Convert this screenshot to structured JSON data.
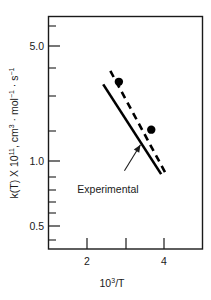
{
  "chart_data": {
    "type": "line",
    "title": "",
    "xlabel": "10^3/T",
    "xlabel_base": "10",
    "xlabel_exp": "3",
    "xlabel_tail": "/T",
    "ylabel": "k(T) X 10^11, cm^3 . mol^-1 . s^-1",
    "ylabel_parts": {
      "p1": "k(T) X 10",
      "p2": "11",
      "p3": ", cm",
      "p4": "3",
      "p5": " · mol",
      "p6": "−1",
      "p7": " · s",
      "p8": "−1"
    },
    "xscale": "log",
    "yscale": "log",
    "xlim": [
      1.35,
      5.2
    ],
    "ylim": [
      0.38,
      7.2
    ],
    "grid": false,
    "legend": "none",
    "x_ticks": [
      {
        "value": 2,
        "label": "2",
        "major": true
      },
      {
        "value": 3,
        "label": "",
        "major": true
      },
      {
        "value": 4,
        "label": "4",
        "major": true
      }
    ],
    "y_ticks": [
      {
        "value": 5.0,
        "label": "5.0",
        "major": true
      },
      {
        "value": 4.0,
        "label": "",
        "major": false
      },
      {
        "value": 3.0,
        "label": "",
        "major": false
      },
      {
        "value": 2.0,
        "label": "",
        "major": false
      },
      {
        "value": 1.0,
        "label": "1.0",
        "major": true
      },
      {
        "value": 0.9,
        "label": "",
        "major": false
      },
      {
        "value": 0.8,
        "label": "",
        "major": false
      },
      {
        "value": 0.7,
        "label": "",
        "major": false
      },
      {
        "value": 0.6,
        "label": "",
        "major": false
      },
      {
        "value": 0.5,
        "label": "0.5",
        "major": true
      }
    ],
    "series": [
      {
        "name": "Experimental",
        "style": "solid",
        "x": [
          2.18,
          3.62
        ],
        "y": [
          3.05,
          0.98
        ]
      },
      {
        "name": "Calculated",
        "style": "dashed",
        "x": [
          2.32,
          3.78
        ],
        "y": [
          3.62,
          0.98
        ]
      }
    ],
    "points": [
      {
        "x": 2.5,
        "y": 3.15
      },
      {
        "x": 3.32,
        "y": 1.72
      }
    ],
    "annotations": [
      {
        "text": "Experimental",
        "target_x": 3.02,
        "target_y": 1.42
      }
    ]
  },
  "figure": {
    "annotation_label": "Experimental"
  }
}
